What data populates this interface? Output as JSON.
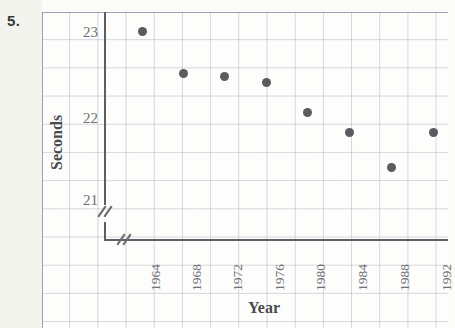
{
  "problem_number": "5.",
  "chart_data": {
    "type": "scatter",
    "title": "",
    "xlabel": "Year",
    "ylabel": "Seconds",
    "x": [
      1964,
      1968,
      1972,
      1976,
      1980,
      1984,
      1988,
      1992
    ],
    "values": [
      23.0,
      22.5,
      22.45,
      22.4,
      22.05,
      21.8,
      21.4,
      21.8
    ],
    "categories": [
      "1964",
      "1968",
      "1972",
      "1976",
      "1980",
      "1984",
      "1988",
      "1992"
    ],
    "xtick_labels": [
      "1964",
      "1968",
      "1972",
      "1976",
      "1980",
      "1984",
      "1988",
      "1992"
    ],
    "ytick_labels": [
      "21",
      "22",
      "23"
    ],
    "ytick_values": [
      21,
      22,
      23
    ],
    "ylim": [
      20.8,
      23.2
    ],
    "xlim": [
      1962,
      1994
    ],
    "grid": true,
    "legend": null,
    "axis_break_x": true,
    "axis_break_y": true,
    "marker_color": "#5b5b62",
    "grid_color": "#96a5b9",
    "axis_color": "#5d5d63",
    "background_color": "#fdfdfb"
  },
  "y_ticks": [
    {
      "label": "23",
      "top": 24
    },
    {
      "label": "22",
      "top": 110
    },
    {
      "label": "21",
      "top": 192
    }
  ],
  "x_ticks": [
    {
      "label": "1964",
      "left": 142
    },
    {
      "label": "1968",
      "left": 183
    },
    {
      "label": "1972",
      "left": 224
    },
    {
      "label": "1976",
      "left": 266
    },
    {
      "label": "1980",
      "left": 307
    },
    {
      "label": "1984",
      "left": 349
    },
    {
      "label": "1988",
      "left": 391
    },
    {
      "label": "1992",
      "left": 433
    }
  ],
  "points": [
    {
      "label": "1964",
      "value": "23.0",
      "left": 142,
      "top": 31
    },
    {
      "label": "1968",
      "value": "22.5",
      "left": 183,
      "top": 73
    },
    {
      "label": "1972",
      "value": "22.45",
      "left": 224,
      "top": 76
    },
    {
      "label": "1976",
      "value": "22.4",
      "left": 266,
      "top": 82
    },
    {
      "label": "1980",
      "value": "22.05",
      "left": 307,
      "top": 112
    },
    {
      "label": "1984",
      "value": "21.8",
      "left": 349,
      "top": 132
    },
    {
      "label": "1988",
      "value": "21.4",
      "left": 391,
      "top": 167
    },
    {
      "label": "1992",
      "value": "21.8",
      "left": 433,
      "top": 132
    }
  ]
}
